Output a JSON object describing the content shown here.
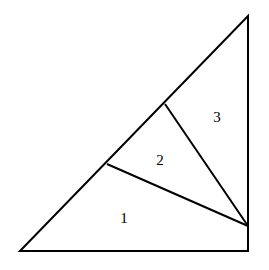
{
  "diagram": {
    "type": "triangle-dissection",
    "stroke_color": "#000000",
    "background": "#ffffff",
    "outer_triangle": {
      "vertices": [
        [
          20,
          251
        ],
        [
          248,
          16
        ],
        [
          248,
          251
        ]
      ]
    },
    "points": {
      "P": [
        107,
        164
      ],
      "Q": [
        165,
        104
      ],
      "R": [
        248,
        226
      ]
    },
    "segments": [
      {
        "from": "P",
        "to": "R"
      },
      {
        "from": "Q",
        "to": "R"
      }
    ],
    "regions": [
      {
        "label": "1",
        "x": 124,
        "y": 223
      },
      {
        "label": "2",
        "x": 160,
        "y": 165
      },
      {
        "label": "3",
        "x": 217,
        "y": 122
      }
    ]
  }
}
